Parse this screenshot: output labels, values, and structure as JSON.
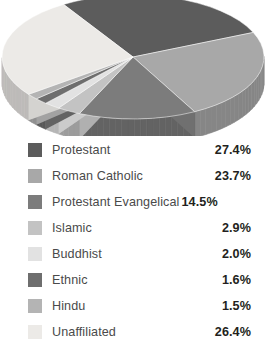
{
  "chart_data": {
    "type": "pie",
    "title": "",
    "subtitle": "",
    "xlabel": "",
    "ylabel": "",
    "legend_position": "bottom",
    "grid": false,
    "three_d": true,
    "units": "%",
    "categories": [
      "Protestant",
      "Roman Catholic",
      "Protestant Evangelical",
      "Islamic",
      "Buddhist",
      "Ethnic",
      "Hindu",
      "Unaffiliated"
    ],
    "values": [
      27.4,
      23.7,
      14.5,
      2.9,
      2.0,
      1.6,
      1.5,
      26.4
    ],
    "value_labels": [
      "27.4%",
      "23.7%",
      "14.5%",
      "2.9%",
      "2.0%",
      "1.6%",
      "1.5%",
      "26.4%"
    ],
    "colors": [
      "#5c5c5c",
      "#a8a8a8",
      "#7c7c7c",
      "#c3c3c3",
      "#e2e2e2",
      "#6e6e6e",
      "#b4b4b4",
      "#eceae7"
    ],
    "slices": [
      {
        "label": "Protestant",
        "value": 27.4,
        "value_label": "27.4%",
        "color": "#5c5c5c"
      },
      {
        "label": "Roman Catholic",
        "value": 23.7,
        "value_label": "23.7%",
        "color": "#a8a8a8"
      },
      {
        "label": "Protestant Evangelical",
        "value": 14.5,
        "value_label": "14.5%",
        "color": "#7c7c7c"
      },
      {
        "label": "Islamic",
        "value": 2.9,
        "value_label": "2.9%",
        "color": "#c3c3c3"
      },
      {
        "label": "Buddhist",
        "value": 2.0,
        "value_label": "2.0%",
        "color": "#e2e2e2"
      },
      {
        "label": "Ethnic",
        "value": 1.6,
        "value_label": "1.6%",
        "color": "#6e6e6e"
      },
      {
        "label": "Hindu",
        "value": 1.5,
        "value_label": "1.5%",
        "color": "#b4b4b4"
      },
      {
        "label": "Unaffiliated",
        "value": 26.4,
        "value_label": "26.4%",
        "color": "#eceae7"
      }
    ]
  },
  "legend": {
    "rows": [
      {
        "label": "Protestant",
        "pct": "27.4%",
        "color": "#5c5c5c"
      },
      {
        "label": "Roman Catholic",
        "pct": "23.7%",
        "color": "#a8a8a8"
      },
      {
        "label": "Protestant Evangelical",
        "pct": "14.5%",
        "color": "#7c7c7c"
      },
      {
        "label": "Islamic",
        "pct": "2.9%",
        "color": "#c3c3c3"
      },
      {
        "label": "Buddhist",
        "pct": "2.0%",
        "color": "#e2e2e2"
      },
      {
        "label": "Ethnic",
        "pct": "1.6%",
        "color": "#6e6e6e"
      },
      {
        "label": "Hindu",
        "pct": "1.5%",
        "color": "#b4b4b4"
      },
      {
        "label": "Unaffiliated",
        "pct": "26.4%",
        "color": "#eceae7"
      }
    ]
  }
}
